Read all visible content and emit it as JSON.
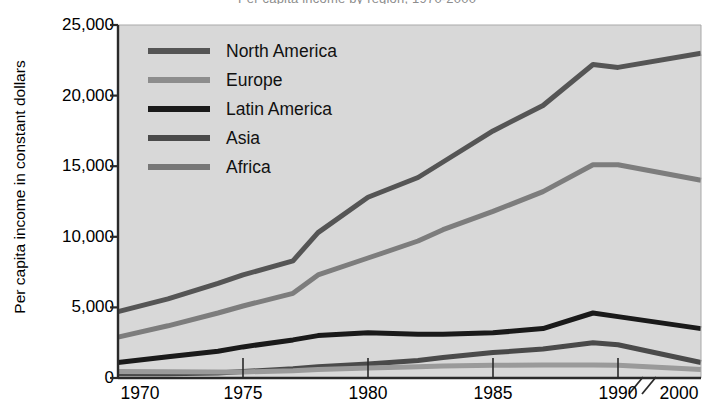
{
  "chart_data": {
    "type": "line",
    "title": "Per capita income by region, 1970-2000",
    "xlabel": "",
    "ylabel": "Per capita income in constant dollars",
    "xlim": [
      1970,
      2000
    ],
    "ylim": [
      0,
      25000
    ],
    "grid": false,
    "legend_position": "upper-left-inside",
    "axis_break": {
      "glyph": "//",
      "between": [
        1990,
        2000
      ],
      "note": "axis break between 1990 and 2000"
    },
    "x_tick_labels": [
      "1970",
      "1975",
      "1980",
      "1985",
      "1990",
      "2000"
    ],
    "x_tick_values": [
      1970,
      1975,
      1980,
      1985,
      1990,
      2000
    ],
    "y_tick_labels": [
      "0",
      "5,000",
      "10,000",
      "15,000",
      "20,000",
      "25,000"
    ],
    "y_tick_values": [
      0,
      5000,
      10000,
      15000,
      20000,
      25000
    ],
    "x": [
      1970,
      1972,
      1974,
      1975,
      1977,
      1978,
      1980,
      1982,
      1983,
      1985,
      1987,
      1989,
      1990,
      2000
    ],
    "series": [
      {
        "name": "North America",
        "color": "#555555",
        "width": 5,
        "values": [
          4700,
          5600,
          6700,
          7300,
          8300,
          10300,
          12800,
          14200,
          15300,
          17500,
          19300,
          22200,
          22000,
          23000
        ]
      },
      {
        "name": "Europe",
        "color": "#7d7d7d",
        "width": 5,
        "values": [
          2900,
          3700,
          4600,
          5100,
          6000,
          7300,
          8500,
          9700,
          10500,
          11800,
          13200,
          15100,
          15100,
          14000
        ]
      },
      {
        "name": "Latin America",
        "color": "#1a1a1a",
        "width": 5,
        "values": [
          1100,
          1500,
          1900,
          2200,
          2700,
          3000,
          3200,
          3100,
          3100,
          3200,
          3500,
          4600,
          4350,
          3500
        ]
      },
      {
        "name": "Asia",
        "color": "#4a4a4a",
        "width": 5,
        "values": [
          300,
          300,
          350,
          450,
          650,
          800,
          1000,
          1250,
          1450,
          1800,
          2050,
          2500,
          2350,
          1100
        ]
      },
      {
        "name": "Africa",
        "color": "#9a9a9a",
        "width": 5,
        "values": [
          450,
          440,
          430,
          430,
          520,
          600,
          700,
          800,
          850,
          900,
          920,
          930,
          900,
          600
        ]
      }
    ]
  },
  "legend": {
    "items": [
      {
        "label": "North America",
        "color": "#555555"
      },
      {
        "label": "Europe",
        "color": "#8d8d8d"
      },
      {
        "label": "Latin America",
        "color": "#1a1a1a"
      },
      {
        "label": "Asia",
        "color": "#4a4a4a"
      },
      {
        "label": "Africa",
        "color": "#777777"
      }
    ]
  },
  "style": {
    "plot_background": "#d8d8d8",
    "page_background": "#ffffff",
    "axis_color": "#2a2a2a"
  }
}
